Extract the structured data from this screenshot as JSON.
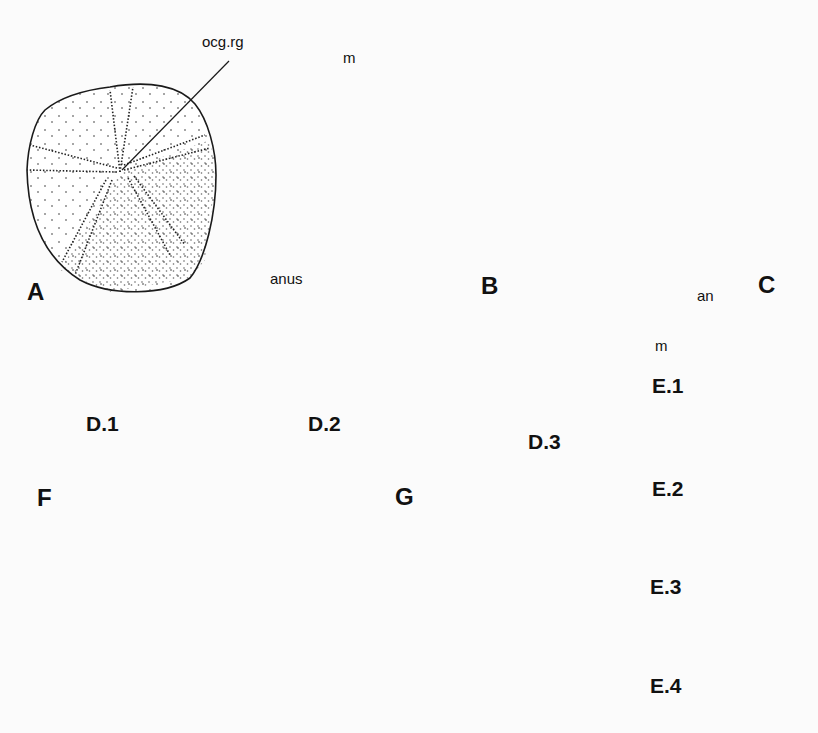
{
  "figure": {
    "panels": [
      {
        "id": "A",
        "label": "A",
        "annotations": [
          "ocg.rg"
        ],
        "view": "aboral view, stippled test with ambulacral pore rows radiating from oculogenital ring"
      },
      {
        "id": "B",
        "label": "B",
        "annotations": [
          "m",
          "anus"
        ],
        "view": "oral/lateral view showing mouth and anus"
      },
      {
        "id": "C",
        "label": "C",
        "annotations": [],
        "view": "lateral view, stippled test"
      },
      {
        "id": "D1",
        "label": "D.1",
        "annotations": [],
        "view": "profile outline, very flat"
      },
      {
        "id": "D2",
        "label": "D.2",
        "annotations": [],
        "view": "profile outline, low dome"
      },
      {
        "id": "D3",
        "label": "D.3",
        "annotations": [],
        "view": "profile outline, high dome"
      },
      {
        "id": "E1",
        "label": "E.1",
        "annotations": [
          "an",
          "m"
        ],
        "view": "profile outline with anus at top"
      },
      {
        "id": "E2",
        "label": "E.2",
        "annotations": [],
        "view": "profile outline with anus on upper side"
      },
      {
        "id": "E3",
        "label": "E.3",
        "annotations": [],
        "view": "profile outline with anus at lower margin"
      },
      {
        "id": "E4",
        "label": "E.4",
        "annotations": [],
        "view": "profile outline with anus on oral side"
      },
      {
        "id": "F",
        "label": "F",
        "annotations": [],
        "view": "sand dollar with lunule and notched margin, petaloid ambulacra"
      },
      {
        "id": "G",
        "label": "G",
        "annotations": [],
        "view": "oval test with petaloid ambulacra and periproct"
      }
    ],
    "labels": {
      "A": "A",
      "B": "B",
      "C": "C",
      "D1": "D.1",
      "D2": "D.2",
      "D3": "D.3",
      "E1": "E.1",
      "E2": "E.2",
      "E3": "E.3",
      "E4": "E.4",
      "F": "F",
      "G": "G",
      "ocg_rg": "ocg.rg",
      "m_B": "m",
      "anus": "anus",
      "an": "an",
      "m_E": "m"
    },
    "colors": {
      "ink": "#1a1a1a",
      "paper": "#fbfbfb"
    }
  }
}
